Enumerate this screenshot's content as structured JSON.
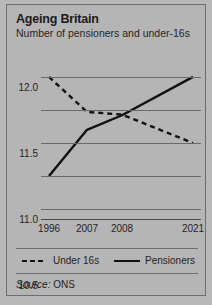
{
  "panel": {
    "title": "Ageing Britain",
    "subtitle": "Number of pensioners and under-16s",
    "source_label": "Source:",
    "source_value": "ONS",
    "background_color": "#b5b5b5",
    "border_color": "#6d6d6d",
    "line_color": "#111111"
  },
  "legend": {
    "under16_label": "Under 16s",
    "pensioners_label": "Pensioners"
  },
  "chart_data": {
    "type": "line",
    "title": "Ageing Britain",
    "subtitle": "Number of pensioners and under-16s",
    "xlabel": "",
    "ylabel": "",
    "x": [
      "1996",
      "2007",
      "2008",
      "2021"
    ],
    "categories": [
      "1996",
      "2007",
      "2008",
      "2021"
    ],
    "yticks": [
      "10.0",
      "10.5",
      "11.0",
      "11.5",
      "12.0"
    ],
    "ytick_values": [
      10.0,
      10.5,
      11.0,
      11.5,
      12.0
    ],
    "ylim": [
      9.85,
      12.15
    ],
    "grid": true,
    "legend_position": "bottom",
    "series": [
      {
        "name": "Under 16s",
        "style": "dashed",
        "color": "#111111",
        "values": [
          12.0,
          11.47,
          11.43,
          11.0
        ]
      },
      {
        "name": "Pensioners",
        "style": "solid",
        "color": "#111111",
        "values": [
          10.5,
          11.2,
          11.42,
          12.0
        ]
      }
    ]
  }
}
